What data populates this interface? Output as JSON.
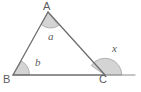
{
  "figure": {
    "type": "geometry-diagram",
    "width": 141,
    "height": 92,
    "background_color": "#ffffff",
    "stroke_color": "#6e6e6e",
    "arc_fill_color": "#d4d4d4",
    "arc_stroke_color": "#9a9a9a",
    "text_color": "#5b5b5b",
    "vertices": [
      {
        "name": "A",
        "label": "A",
        "x": 48,
        "y": 12
      },
      {
        "name": "B",
        "label": "B",
        "x": 13,
        "y": 75
      },
      {
        "name": "C",
        "label": "C",
        "x": 105,
        "y": 75
      }
    ],
    "segments": [
      {
        "name": "side-AB",
        "from": "B",
        "to": "A"
      },
      {
        "name": "side-AC",
        "from": "A",
        "to": "C"
      },
      {
        "name": "base-BC",
        "from": "B",
        "to": "C"
      },
      {
        "name": "base-extension",
        "from": "C",
        "to": "end",
        "end_x": 135,
        "end_y": 75
      }
    ],
    "angles": [
      {
        "name": "angle-a",
        "label": "a",
        "at_vertex": "A",
        "kind": "interior"
      },
      {
        "name": "angle-b",
        "label": "b",
        "at_vertex": "B",
        "kind": "interior"
      },
      {
        "name": "angle-x",
        "label": "x",
        "at_vertex": "C",
        "kind": "exterior"
      }
    ]
  }
}
